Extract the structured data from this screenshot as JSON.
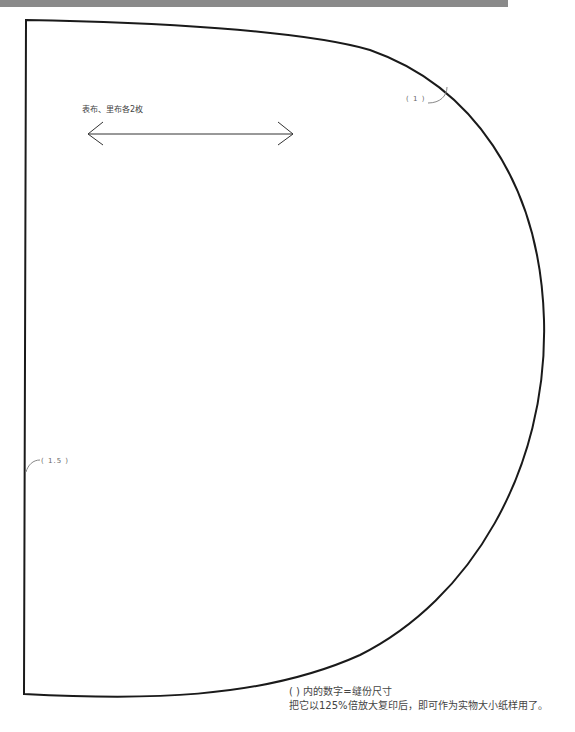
{
  "pattern": {
    "title": "",
    "grain_line_label": "表布、里布各2枚",
    "seam_allowances": {
      "top_curve": "( 1 )",
      "left_edge": "( 1.5 )"
    },
    "notes": {
      "line1": "( ) 内的数字=缝份尺寸",
      "line2": "把它以125%倍放大复印后，即可作为实物大小纸样用了。"
    },
    "colors": {
      "outline": "#1a1a1a",
      "leader": "#888888",
      "arrow": "#333333",
      "header_band": "#8a8a8a"
    }
  }
}
